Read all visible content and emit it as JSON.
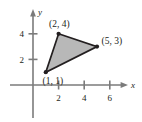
{
  "figure": {
    "kind": "coordinate-plane-triangle",
    "background_color": "#ffffff"
  },
  "chart_data": {
    "type": "scatter",
    "title": "",
    "subtitle": "",
    "xlabel": "x",
    "ylabel": "y",
    "xlim": [
      -0.6,
      7.4
    ],
    "ylim": [
      -1.3,
      5.6
    ],
    "xticks": [
      2,
      4,
      6
    ],
    "yticks": [
      2,
      4
    ],
    "xtick_labels": [
      "2",
      "4",
      "6"
    ],
    "ytick_labels": [
      "2",
      "4"
    ],
    "grid": false,
    "legend": "none",
    "annotations": [
      "(1, 1)",
      "(2, 4)",
      "(5, 3)"
    ],
    "series": [
      {
        "name": "triangle",
        "shape": "polygon",
        "closed": true,
        "fill_color": "#b8b8b8",
        "stroke_color": "#231f20",
        "marker": "dot",
        "marker_color": "#231f20",
        "points": [
          {
            "x": 1,
            "y": 1,
            "label": "(1, 1)"
          },
          {
            "x": 2,
            "y": 4,
            "label": "(2, 4)"
          },
          {
            "x": 5,
            "y": 3,
            "label": "(5, 3)"
          }
        ]
      }
    ]
  },
  "axes": {
    "x_axis_label": "x",
    "y_axis_label": "y",
    "axis_color": "#7b7b7b",
    "origin_px": {
      "x": 33,
      "y": 85
    },
    "unit_px": 12.8
  },
  "labels": {
    "vertex_bottom_left": "(1, 1)",
    "vertex_top": "(2, 4)",
    "vertex_right": "(5, 3)",
    "xtick_2": "2",
    "xtick_4": "4",
    "xtick_6": "6",
    "ytick_2": "2",
    "ytick_4": "4"
  },
  "colors": {
    "triangle_fill": "#b8b8b8",
    "triangle_stroke": "#231f20",
    "axis": "#7b7b7b",
    "text": "#231f20"
  }
}
